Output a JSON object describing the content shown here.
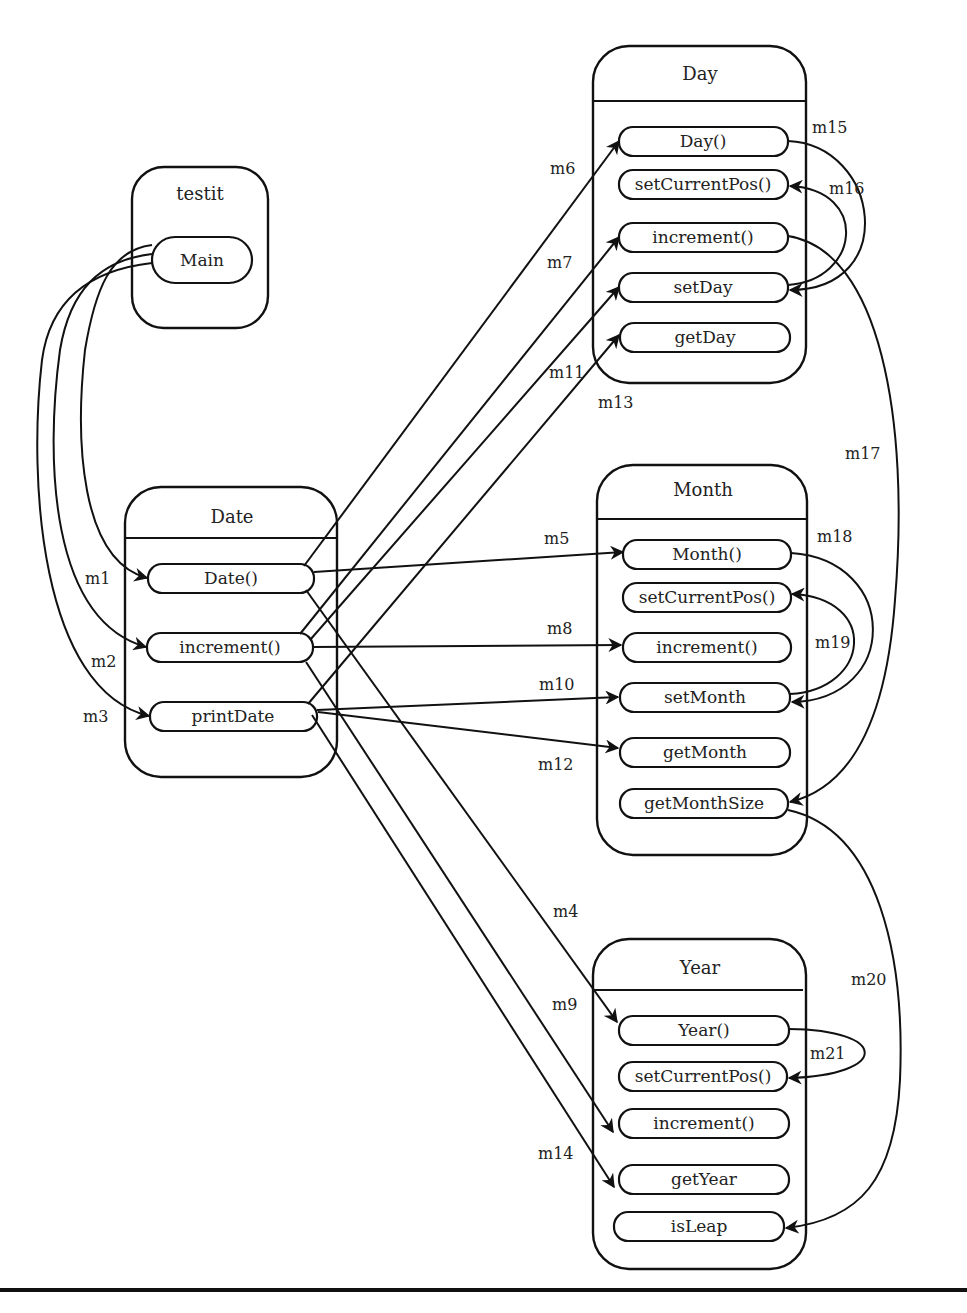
{
  "classes": {
    "testit": {
      "title": "testit",
      "methods": [
        "Main"
      ]
    },
    "date": {
      "title": "Date",
      "methods": [
        "Date()",
        "increment()",
        "printDate"
      ]
    },
    "day": {
      "title": "Day",
      "methods": [
        "Day()",
        "setCurrentPos()",
        "increment()",
        "setDay",
        "getDay"
      ]
    },
    "month": {
      "title": "Month",
      "methods": [
        "Month()",
        "setCurrentPos()",
        "increment()",
        "setMonth",
        "getMonth",
        "getMonthSize"
      ]
    },
    "year": {
      "title": "Year",
      "methods": [
        "Year()",
        "setCurrentPos()",
        "increment()",
        "getYear",
        "isLeap"
      ]
    }
  },
  "messages": [
    {
      "id": "m1",
      "from": "testit.Main",
      "to": "Date.Date()"
    },
    {
      "id": "m2",
      "from": "testit.Main",
      "to": "Date.increment()"
    },
    {
      "id": "m3",
      "from": "testit.Main",
      "to": "Date.printDate"
    },
    {
      "id": "m4",
      "from": "Date.Date()",
      "to": "Year.Year()"
    },
    {
      "id": "m5",
      "from": "Date.Date()",
      "to": "Month.Month()"
    },
    {
      "id": "m6",
      "from": "Date.Date()",
      "to": "Day.Day()"
    },
    {
      "id": "m7",
      "from": "Date.increment()",
      "to": "Day.increment()"
    },
    {
      "id": "m8",
      "from": "Date.increment()",
      "to": "Month.increment()"
    },
    {
      "id": "m9",
      "from": "Date.increment()",
      "to": "Year.increment()"
    },
    {
      "id": "m10",
      "from": "Date.printDate",
      "to": "Month.setMonth"
    },
    {
      "id": "m11",
      "from": "Date.increment()",
      "to": "Day.setDay"
    },
    {
      "id": "m12",
      "from": "Date.printDate",
      "to": "Month.getMonth"
    },
    {
      "id": "m13",
      "from": "Date.printDate",
      "to": "Day.getDay"
    },
    {
      "id": "m14",
      "from": "Date.printDate",
      "to": "Year.getYear"
    },
    {
      "id": "m15",
      "from": "Day.Day()",
      "to": "Day.setDay"
    },
    {
      "id": "m16",
      "from": "Day.setDay",
      "to": "Day.setCurrentPos()"
    },
    {
      "id": "m17",
      "from": "Day.increment()",
      "to": "Month.getMonthSize"
    },
    {
      "id": "m18",
      "from": "Month.Month()",
      "to": "Month.setMonth"
    },
    {
      "id": "m19",
      "from": "Month.setMonth",
      "to": "Month.setCurrentPos()"
    },
    {
      "id": "m20",
      "from": "Month.getMonthSize",
      "to": "Year.isLeap"
    },
    {
      "id": "m21",
      "from": "Year.Year()",
      "to": "Year.setCurrentPos()"
    }
  ],
  "labels": {
    "m1": "m1",
    "m2": "m2",
    "m3": "m3",
    "m4": "m4",
    "m5": "m5",
    "m6": "m6",
    "m7": "m7",
    "m8": "m8",
    "m9": "m9",
    "m10": "m10",
    "m11": "m11",
    "m12": "m12",
    "m13": "m13",
    "m14": "m14",
    "m15": "m15",
    "m16": "m16",
    "m17": "m17",
    "m18": "m18",
    "m19": "m19",
    "m20": "m20",
    "m21": "m21"
  }
}
